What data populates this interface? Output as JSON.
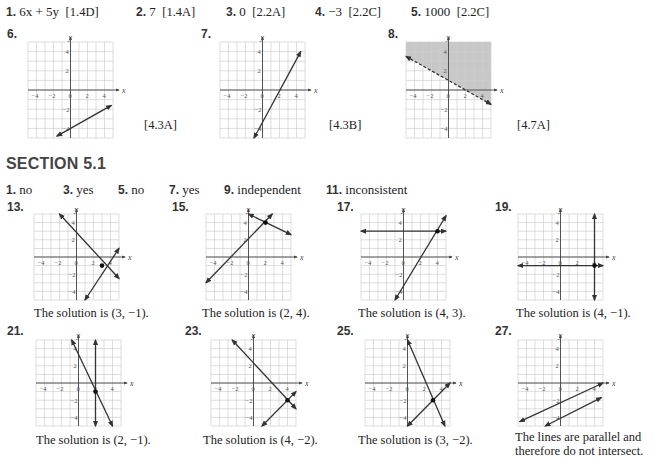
{
  "review": {
    "items": [
      {
        "num": "1.",
        "answer": "6x + 5y",
        "ref": "[1.4D]"
      },
      {
        "num": "2.",
        "answer": "7",
        "ref": "[1.4A]"
      },
      {
        "num": "3.",
        "answer": "0",
        "ref": "[2.2A]"
      },
      {
        "num": "4.",
        "answer": "−3",
        "ref": "[2.2C]"
      },
      {
        "num": "5.",
        "answer": "1000",
        "ref": "[2.2C]"
      }
    ],
    "graphs": [
      {
        "num": "6.",
        "ref": "[4.3A]"
      },
      {
        "num": "7.",
        "ref": "[4.3B]"
      },
      {
        "num": "8.",
        "ref": "[4.7A]"
      }
    ]
  },
  "section": {
    "title": "SECTION 5.1",
    "short_answers": [
      {
        "num": "1.",
        "answer": "no"
      },
      {
        "num": "3.",
        "answer": "yes"
      },
      {
        "num": "5.",
        "answer": "no"
      },
      {
        "num": "7.",
        "answer": "yes"
      },
      {
        "num": "9.",
        "answer": "independent"
      },
      {
        "num": "11.",
        "answer": "inconsistent"
      }
    ],
    "graphs": [
      {
        "num": "13.",
        "caption": "The solution is (3, −1)."
      },
      {
        "num": "15.",
        "caption": "The solution is (2, 4)."
      },
      {
        "num": "17.",
        "caption": "The solution is (4, 3)."
      },
      {
        "num": "19.",
        "caption": "The solution is (4, −1)."
      },
      {
        "num": "21.",
        "caption": "The solution is (2, −1)."
      },
      {
        "num": "23.",
        "caption": "The solution is (4, −2)."
      },
      {
        "num": "25.",
        "caption": "The solution is (3, −2)."
      },
      {
        "num": "27.",
        "caption_line1": "The lines are parallel and",
        "caption_line2": "therefore do not intersect."
      }
    ]
  },
  "axis_labels": {
    "x": "x",
    "y": "y",
    "ticks_x": [
      "−4",
      "−2",
      "0",
      "2",
      "4"
    ],
    "ticks_y": [
      "4",
      "2",
      "−2",
      "−4"
    ]
  },
  "colors": {
    "grid": "#cfcfcf",
    "axis": "#444444",
    "line": "#333333",
    "shade": "#c8c8c8"
  },
  "chart_data": [
    {
      "id": "6",
      "type": "line",
      "xlim": [
        -5,
        5
      ],
      "ylim": [
        -5,
        5
      ],
      "lines": [
        {
          "p1": [
            -1.6,
            -4.8
          ],
          "p2": [
            4.8,
            -1.6
          ],
          "style": "solid"
        }
      ]
    },
    {
      "id": "7",
      "type": "line",
      "xlim": [
        -5,
        5
      ],
      "ylim": [
        -5,
        5
      ],
      "lines": [
        {
          "p1": [
            -1,
            -5
          ],
          "p2": [
            4.5,
            4
          ]
        }
      ]
    },
    {
      "id": "8",
      "type": "inequality",
      "xlim": [
        -5,
        5
      ],
      "ylim": [
        -5,
        5
      ],
      "lines": [
        {
          "p1": [
            -5,
            3.5
          ],
          "p2": [
            5,
            -1.5
          ],
          "style": "dashed"
        }
      ],
      "shade": "above"
    },
    {
      "id": "13",
      "type": "line",
      "xlim": [
        -5,
        5
      ],
      "ylim": [
        -5,
        5
      ],
      "lines": [
        {
          "p1": [
            -2,
            5
          ],
          "p2": [
            5,
            -2.5
          ]
        },
        {
          "p1": [
            1,
            -5
          ],
          "p2": [
            5,
            1
          ]
        }
      ],
      "solution": [
        3,
        -1
      ]
    },
    {
      "id": "15",
      "type": "line",
      "xlim": [
        -5,
        5
      ],
      "ylim": [
        -5,
        5
      ],
      "lines": [
        {
          "p1": [
            -5,
            -3
          ],
          "p2": [
            2.8,
            5
          ]
        },
        {
          "p1": [
            0,
            5
          ],
          "p2": [
            5,
            2.6
          ]
        }
      ],
      "solution": [
        2,
        4
      ]
    },
    {
      "id": "17",
      "type": "line",
      "xlim": [
        -5,
        5
      ],
      "ylim": [
        -5,
        5
      ],
      "lines": [
        {
          "p1": [
            -5,
            3
          ],
          "p2": [
            5,
            3
          ]
        },
        {
          "p1": [
            -1,
            -5
          ],
          "p2": [
            5,
            4.8
          ]
        }
      ],
      "solution": [
        4,
        3
      ]
    },
    {
      "id": "19",
      "type": "line",
      "xlim": [
        -5,
        5
      ],
      "ylim": [
        -5,
        5
      ],
      "lines": [
        {
          "p1": [
            -5,
            -1
          ],
          "p2": [
            5,
            -1
          ]
        },
        {
          "p1": [
            4,
            5
          ],
          "p2": [
            4,
            -5
          ]
        }
      ],
      "solution": [
        4,
        -1
      ]
    },
    {
      "id": "21",
      "type": "line",
      "xlim": [
        -5,
        5
      ],
      "ylim": [
        -5,
        5
      ],
      "lines": [
        {
          "p1": [
            -0.8,
            5
          ],
          "p2": [
            4,
            -5
          ]
        },
        {
          "p1": [
            2,
            5
          ],
          "p2": [
            2,
            -5
          ]
        }
      ],
      "solution": [
        2,
        -1
      ]
    },
    {
      "id": "23",
      "type": "line",
      "xlim": [
        -5,
        5
      ],
      "ylim": [
        -5,
        5
      ],
      "lines": [
        {
          "p1": [
            -2.5,
            5
          ],
          "p2": [
            5,
            -3
          ]
        },
        {
          "p1": [
            1,
            -5
          ],
          "p2": [
            5,
            -1
          ]
        }
      ],
      "solution": [
        4,
        -2
      ]
    },
    {
      "id": "25",
      "type": "line",
      "xlim": [
        -5,
        5
      ],
      "ylim": [
        -5,
        5
      ],
      "lines": [
        {
          "p1": [
            0,
            5
          ],
          "p2": [
            4.4,
            -5
          ]
        },
        {
          "p1": [
            0,
            -5
          ],
          "p2": [
            5,
            0
          ]
        }
      ],
      "solution": [
        3,
        -2
      ]
    },
    {
      "id": "27",
      "type": "line",
      "xlim": [
        -5,
        5
      ],
      "ylim": [
        -5,
        5
      ],
      "lines": [
        {
          "p1": [
            -4.8,
            -4.5
          ],
          "p2": [
            5,
            0
          ]
        },
        {
          "p1": [
            -1.8,
            -5
          ],
          "p2": [
            4.8,
            -1.7
          ]
        }
      ]
    }
  ]
}
